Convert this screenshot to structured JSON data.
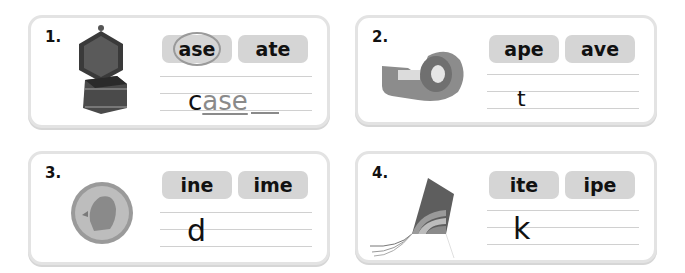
{
  "exercises": [
    {
      "number": "1.",
      "picture": "jewelry-box",
      "choices": [
        "ase",
        "ate"
      ],
      "selected_choice": "ase",
      "start_letter": "c",
      "answer_fill": "ase"
    },
    {
      "number": "2.",
      "picture": "tape-dispenser",
      "choices": [
        "ape",
        "ave"
      ],
      "start_letter": "t",
      "answer_fill": ""
    },
    {
      "number": "3.",
      "picture": "dime-coin",
      "choices": [
        "ine",
        "ime"
      ],
      "start_letter": "d",
      "answer_fill": ""
    },
    {
      "number": "4.",
      "picture": "kite",
      "choices": [
        "ite",
        "ipe"
      ],
      "start_letter": "k",
      "answer_fill": ""
    }
  ],
  "colors": {
    "card_border": "#e3e3e3",
    "chip_bg": "#d5d5d5",
    "answer_gray": "#8a8a8a",
    "text": "#111111"
  }
}
